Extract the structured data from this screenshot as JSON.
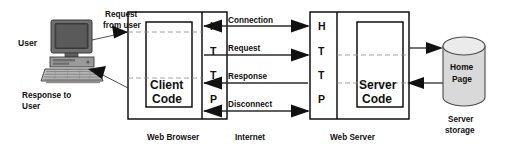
{
  "diagram": {
    "actor": {
      "label": "User",
      "icon": "desktop-computer-icon"
    },
    "user_flows": [
      {
        "id": "request-from-user",
        "line1": "Request",
        "line2": "from user",
        "direction": "right"
      },
      {
        "id": "response-to-user",
        "line1": "Response to",
        "line2": "User",
        "direction": "left"
      }
    ],
    "client": {
      "outer_label": "Web Browser",
      "inner_label_line1": "Client",
      "inner_label_line2": "Code",
      "protocol_letters": [
        "H",
        "T",
        "T",
        "P"
      ]
    },
    "server": {
      "outer_label": "Web Server",
      "inner_label_line1": "Server",
      "inner_label_line2": "Code",
      "protocol_letters": [
        "H",
        "T",
        "T",
        "P"
      ]
    },
    "network": {
      "label": "Internet",
      "messages": [
        {
          "id": "connection",
          "label": "Connection",
          "direction": "both"
        },
        {
          "id": "request",
          "label": "Request",
          "direction": "right"
        },
        {
          "id": "response",
          "label": "Response",
          "direction": "left"
        },
        {
          "id": "disconnect",
          "label": "Disconnect",
          "direction": "both"
        }
      ]
    },
    "storage": {
      "label_line1": "Home",
      "label_line2": "Page",
      "caption_line1": "Server",
      "caption_line2": "storage",
      "icon": "database-cylinder-icon",
      "flows": [
        {
          "id": "storage-read-in",
          "direction": "right"
        },
        {
          "id": "storage-read-out",
          "direction": "left"
        }
      ]
    },
    "colors": {
      "ink": "#000000",
      "arrow": "#111111",
      "dashed_guide": "#8a8a8a",
      "cylinder_body": "#d9d9d9",
      "cylinder_top": "#ebebeb"
    }
  }
}
